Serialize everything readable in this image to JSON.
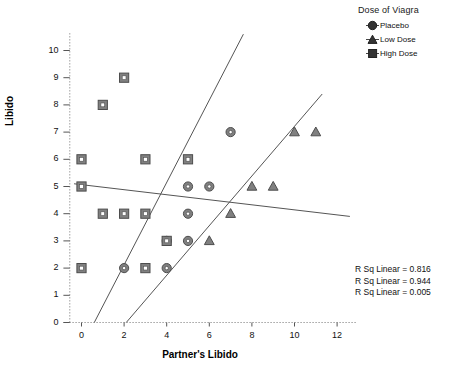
{
  "chart_data": {
    "type": "scatter",
    "title": "",
    "xlabel": "Partner's Libido",
    "ylabel": "Libido",
    "xlim": [
      -0.8,
      12.8
    ],
    "ylim": [
      0,
      10.6
    ],
    "xticks": [
      0,
      2,
      4,
      6,
      8,
      10,
      12
    ],
    "yticks": [
      0,
      1,
      2,
      3,
      4,
      5,
      6,
      7,
      8,
      9,
      10
    ],
    "grid": false,
    "legend_position": "top-right",
    "legend_title": "Dose of Viagra",
    "series": [
      {
        "name": "Placebo",
        "marker": "circle",
        "color": "#808080",
        "points": [
          [
            2,
            2
          ],
          [
            4,
            2
          ],
          [
            4,
            3
          ],
          [
            5,
            3
          ],
          [
            5,
            4
          ],
          [
            5,
            5
          ],
          [
            6,
            5
          ],
          [
            7,
            7
          ]
        ],
        "fit_line": {
          "x0": 0.6,
          "y0": 0,
          "x1": 7.6,
          "y1": 10.6
        },
        "r_sq_linear": 0.816
      },
      {
        "name": "Low Dose",
        "marker": "triangle",
        "color": "#808080",
        "points": [
          [
            6,
            3
          ],
          [
            7,
            4
          ],
          [
            8,
            5
          ],
          [
            9,
            5
          ],
          [
            10,
            7
          ],
          [
            11,
            7
          ]
        ],
        "fit_line": {
          "x0": 2.1,
          "y0": 0,
          "x1": 11.3,
          "y1": 8.4
        },
        "r_sq_linear": 0.944
      },
      {
        "name": "High Dose",
        "marker": "square",
        "color": "#808080",
        "points": [
          [
            0,
            2
          ],
          [
            3,
            2
          ],
          [
            1,
            4
          ],
          [
            2,
            4
          ],
          [
            3,
            4
          ],
          [
            0,
            5
          ],
          [
            0,
            6
          ],
          [
            3,
            6
          ],
          [
            5,
            6
          ],
          [
            1,
            8
          ],
          [
            2,
            9
          ],
          [
            4,
            3
          ]
        ],
        "fit_line": {
          "x0": -0.35,
          "y0": 5.1,
          "x1": 12.6,
          "y1": 3.9
        },
        "r_sq_linear": 0.005
      }
    ],
    "annotations": [
      "R Sq Linear = 0.816",
      "R Sq Linear = 0.944",
      "R Sq Linear = 0.005"
    ]
  },
  "legend": {
    "title": "Dose of Viagra",
    "items": [
      {
        "label": "Placebo",
        "marker": "circle"
      },
      {
        "label": "Low Dose",
        "marker": "triangle"
      },
      {
        "label": "High Dose",
        "marker": "square"
      }
    ]
  },
  "annotations": {
    "line1": "R Sq Linear = 0.816",
    "line2": "R Sq Linear = 0.944",
    "line3": "R Sq Linear = 0.005"
  },
  "axes": {
    "x_title": "Partner's Libido",
    "y_title": "Libido",
    "x_tick_labels": [
      "0",
      "2",
      "4",
      "6",
      "8",
      "10",
      "12"
    ],
    "y_tick_labels": [
      "0",
      "1",
      "2",
      "3",
      "4",
      "5",
      "6",
      "7",
      "8",
      "9",
      "10"
    ]
  },
  "colors": {
    "marker_fill": "#808080",
    "marker_stroke": "#4d4d4d",
    "line": "#555555",
    "axis": "#999999",
    "text": "#111111"
  }
}
